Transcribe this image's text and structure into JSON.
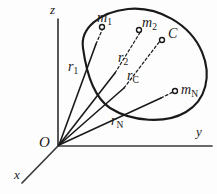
{
  "figure": {
    "background_color": "#fdfdfd",
    "ink_color": "#1a1a1a"
  },
  "axes": {
    "z_label": "z",
    "y_label": "y",
    "x_label": "x",
    "origin_label": "O"
  },
  "masses": [
    {
      "id": "m1",
      "base": "m",
      "sub": "1"
    },
    {
      "id": "m2",
      "base": "m",
      "sub": "2"
    },
    {
      "id": "mN",
      "base": "m",
      "sub": "N"
    }
  ],
  "center_of_mass": {
    "label": "C"
  },
  "vectors": [
    {
      "id": "r1",
      "base": "r",
      "sub": "1"
    },
    {
      "id": "r2",
      "base": "r",
      "sub": "2"
    },
    {
      "id": "rc",
      "base": "r",
      "sub": "C"
    },
    {
      "id": "rN",
      "base": "r",
      "sub": "N"
    }
  ],
  "labels": {
    "m1_base": "m",
    "m1_sub": "1",
    "m2_base": "m",
    "m2_sub": "2",
    "mN_base": "m",
    "mN_sub": "N",
    "C": "C",
    "r1_base": "r",
    "r1_sub": "1",
    "r2_base": "r",
    "r2_sub": "2",
    "rc_base": "r",
    "rc_sub": "C",
    "rN_base": "r",
    "rN_sub": "N",
    "z": "z",
    "y": "y",
    "x": "x",
    "O": "O"
  }
}
